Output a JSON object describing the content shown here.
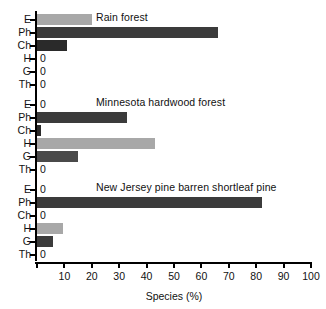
{
  "figure": {
    "clipped_top_text": "",
    "axis_title": "Species (%)",
    "axis_color": "#000000"
  },
  "colors": {
    "dark": "#3b3b3b",
    "medium": "#6e6e6e",
    "light": "#a8a8a8",
    "very_dark": "#2a2a2a"
  },
  "xaxis": {
    "ticks": [
      0,
      10,
      20,
      30,
      40,
      50,
      60,
      70,
      80,
      90,
      100
    ],
    "tick_labels": [
      "",
      "10",
      "20",
      "30",
      "40",
      "50",
      "60",
      "70",
      "80",
      "90",
      "100"
    ],
    "min": 0,
    "max": 100,
    "label": "Species (%)"
  },
  "categories": [
    "E",
    "Ph",
    "Ch",
    "H",
    "G",
    "Th"
  ],
  "chart_data": {
    "type": "bar",
    "orientation": "horizontal",
    "title": "",
    "xlabel": "Species (%)",
    "ylabel": "",
    "xlim": [
      0,
      100
    ],
    "grid": false,
    "legend": null,
    "categories": [
      "E",
      "Ph",
      "Ch",
      "H",
      "G",
      "Th"
    ],
    "panels": [
      {
        "title": "Rain forest",
        "values": [
          20,
          66,
          11,
          0,
          0,
          0
        ],
        "zero_labels": [
          "",
          "",
          "",
          "0",
          "0",
          "0"
        ],
        "bar_colors": [
          "#a8a8a8",
          "#3b3b3b",
          "#2a2a2a",
          "",
          "",
          ""
        ]
      },
      {
        "title": "Minnesota hardwood forest",
        "values": [
          0,
          33,
          1.5,
          43,
          15,
          0
        ],
        "zero_labels": [
          "0",
          "",
          "",
          "",
          "",
          "0"
        ],
        "bar_colors": [
          "",
          "#3b3b3b",
          "#2a2a2a",
          "#a8a8a8",
          "#4a4a4a",
          ""
        ]
      },
      {
        "title": "New Jersey pine barren  shortleaf pine",
        "values": [
          0,
          82,
          0,
          9.5,
          6,
          0
        ],
        "zero_labels": [
          "0",
          "",
          "0",
          "",
          "",
          "0"
        ],
        "bar_colors": [
          "",
          "#3b3b3b",
          "",
          "#a8a8a8",
          "#3b3b3b",
          ""
        ]
      }
    ]
  }
}
